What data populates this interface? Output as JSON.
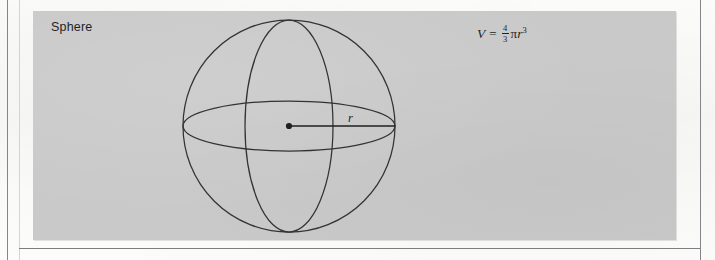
{
  "figure": {
    "shape_label": "Sphere",
    "radius_label": "r",
    "formula": {
      "lhs": "V",
      "equals": "=",
      "fraction_numerator": "4",
      "fraction_denominator": "3",
      "pi": "π",
      "variable": "r",
      "exponent": "3",
      "plain_text": "V = 4/3 πr³"
    },
    "colors": {
      "panel_background": "#c9c9c9",
      "page_background": "#fbfbfa",
      "ink": "#1f1f1f",
      "stroke": "#333333",
      "rule": "#6e7174"
    },
    "geometry": {
      "circle_center_x": 256,
      "circle_center_y": 115,
      "circle_radius": 106,
      "equator_rx": 106,
      "equator_ry": 25,
      "meridian_rx": 44,
      "meridian_ry": 106,
      "radius_line_from_x": 256,
      "radius_line_to_x": 362,
      "radius_line_y": 115,
      "center_dot_radius": 3
    }
  }
}
